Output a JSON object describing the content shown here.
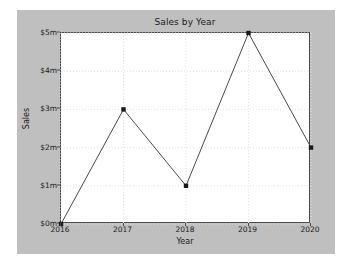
{
  "chart_data": {
    "type": "line",
    "title": "Sales by Year",
    "xlabel": "Year",
    "ylabel": "Sales",
    "x": [
      2016,
      2017,
      2018,
      2019,
      2020
    ],
    "values": [
      0,
      3,
      1,
      5,
      2
    ],
    "categories": [
      "2016",
      "2017",
      "2018",
      "2019",
      "2020"
    ],
    "xtick_labels": [
      "2016",
      "2017",
      "2018",
      "2019",
      "2020"
    ],
    "ytick_labels": [
      "$0m",
      "$1m",
      "$2m",
      "$3m",
      "$4m",
      "$5m"
    ],
    "ytick_values": [
      0,
      1,
      2,
      3,
      4,
      5
    ],
    "xlim": [
      2016,
      2020
    ],
    "ylim": [
      0,
      5
    ],
    "grid": true,
    "legend": "none",
    "series": [
      {
        "name": "Sales",
        "values": [
          0,
          3,
          1,
          5,
          2
        ],
        "marker": "square",
        "color": "#4a4a4a"
      }
    ],
    "units": "millions of dollars",
    "colors": {
      "line": "#4a4a4a",
      "marker": "#1a1a1a",
      "grid": "#e3e3e3",
      "axis": "#4a4a4a",
      "plot_background": "#ffffff",
      "figure_background": "#bfbfbf",
      "page_background": "#ffffff",
      "text": "#1a1a1a"
    }
  }
}
